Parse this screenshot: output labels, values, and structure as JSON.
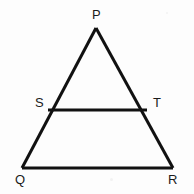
{
  "figure": {
    "name": "triangle-pqr-with-midsegment-st",
    "canvas": {
      "width": 194,
      "height": 194
    },
    "background_color": "#fdfdfd",
    "stroke_color": "#111111",
    "label_color": "#1b1b1b",
    "points": [
      {
        "id": "P",
        "label": "P",
        "x": 96,
        "y": 28,
        "label_x": 92,
        "label_y": 8,
        "role": "apex-vertex"
      },
      {
        "id": "Q",
        "label": "Q",
        "x": 22,
        "y": 168,
        "label_x": 15,
        "label_y": 173,
        "role": "base-left-vertex"
      },
      {
        "id": "R",
        "label": "R",
        "x": 173,
        "y": 168,
        "label_x": 168,
        "label_y": 173,
        "role": "base-right-vertex"
      },
      {
        "id": "S",
        "label": "S",
        "x": 48,
        "y": 110,
        "label_x": 35,
        "label_y": 96,
        "role": "point-on-side-PQ"
      },
      {
        "id": "T",
        "label": "T",
        "x": 147,
        "y": 110,
        "label_x": 153,
        "label_y": 96,
        "role": "point-on-side-PR"
      }
    ],
    "segments": [
      {
        "id": "PQ",
        "from": "P",
        "to": "Q",
        "x1": 96,
        "y1": 28,
        "x2": 22,
        "y2": 168,
        "stroke_width": 3
      },
      {
        "id": "PR",
        "from": "P",
        "to": "R",
        "x1": 96,
        "y1": 28,
        "x2": 173,
        "y2": 168,
        "stroke_width": 3
      },
      {
        "id": "QR",
        "from": "Q",
        "to": "R",
        "x1": 22,
        "y1": 168,
        "x2": 173,
        "y2": 168,
        "stroke_width": 3
      },
      {
        "id": "ST",
        "from": "S",
        "to": "T",
        "x1": 48,
        "y1": 110,
        "x2": 147,
        "y2": 110,
        "stroke_width": 3
      }
    ]
  }
}
